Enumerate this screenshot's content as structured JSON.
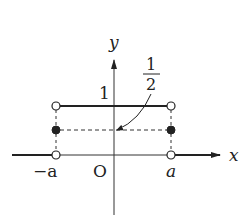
{
  "diagram": {
    "type": "step-function-graph",
    "axes": {
      "x_label": "x",
      "y_label": "y",
      "origin_label": "O"
    },
    "tick_labels": {
      "neg_a": "−a",
      "pos_a": "a"
    },
    "value_labels": {
      "one": "1",
      "half_numerator": "1",
      "half_denominator": "2"
    },
    "points": [
      {
        "name": "(-a, 1)",
        "style": "open"
      },
      {
        "name": "(a, 1)",
        "style": "open"
      },
      {
        "name": "(-a, 1/2)",
        "style": "filled"
      },
      {
        "name": "(a, 1/2)",
        "style": "filled"
      },
      {
        "name": "(-a, 0)",
        "style": "open"
      },
      {
        "name": "(a, 0)",
        "style": "open"
      }
    ],
    "colors": {
      "ink": "#222222",
      "background": "#ffffff"
    }
  }
}
